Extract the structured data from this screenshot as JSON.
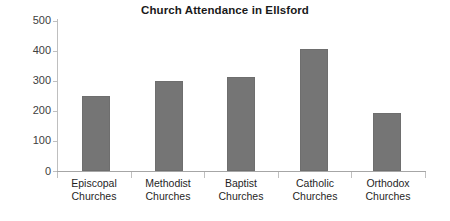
{
  "chart_data": {
    "type": "bar",
    "title": "Church Attendance in Ellsford",
    "xlabel": "",
    "ylabel": "",
    "categories": [
      "Episcopal Churches",
      "Methodist Churches",
      "Baptist Churches",
      "Catholic Churches",
      "Orthodox Churches"
    ],
    "category_lines": [
      [
        "Episcopal",
        "Churches"
      ],
      [
        "Methodist",
        "Churches"
      ],
      [
        "Baptist",
        "Churches"
      ],
      [
        "Catholic",
        "Churches"
      ],
      [
        "Orthodox",
        "Churches"
      ]
    ],
    "values": [
      250,
      300,
      312,
      408,
      195
    ],
    "ylim": [
      0,
      500
    ],
    "yticks": [
      0,
      100,
      200,
      300,
      400,
      500
    ],
    "ytick_labels": [
      "0",
      "100",
      "200",
      "300",
      "400",
      "500"
    ],
    "grid": false,
    "legend": false,
    "bar_color": "#757575",
    "axis_color": "#bfbfbf",
    "title_color": "#1a1a1a"
  }
}
